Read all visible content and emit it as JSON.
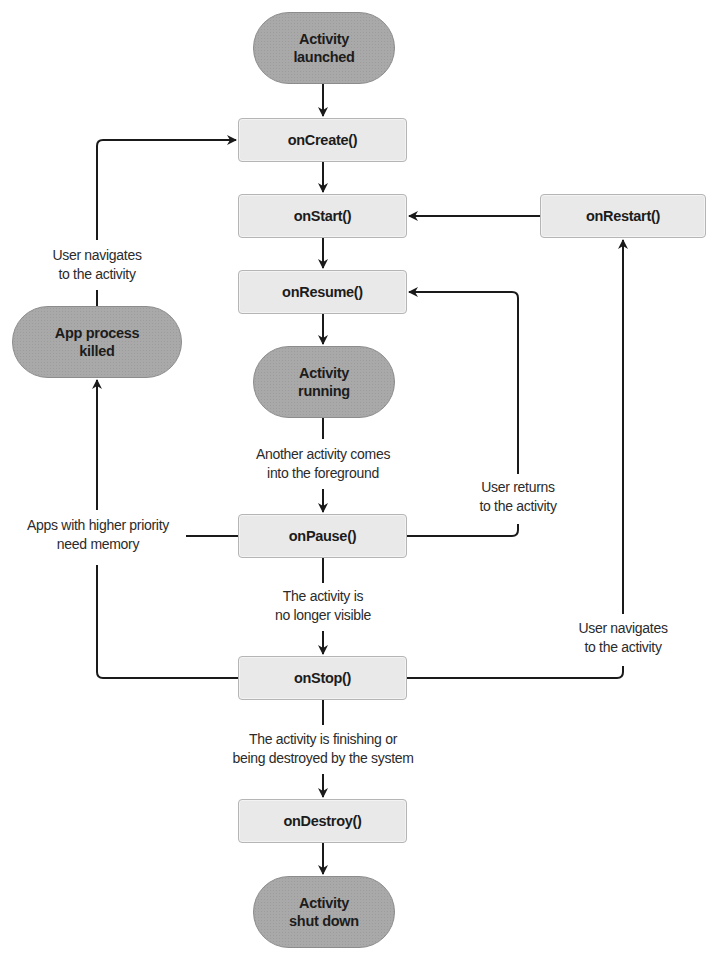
{
  "diagram": {
    "states": {
      "launched": "Activity launched",
      "launched_l1": "Activity",
      "launched_l2": "launched",
      "running_l1": "Activity",
      "running_l2": "running",
      "shutdown_l1": "Activity",
      "shutdown_l2": "shut down",
      "killed_l1": "App process",
      "killed_l2": "killed"
    },
    "methods": {
      "on_create": "onCreate()",
      "on_start": "onStart()",
      "on_resume": "onResume()",
      "on_pause": "onPause()",
      "on_stop": "onStop()",
      "on_destroy": "onDestroy()",
      "on_restart": "onRestart()"
    },
    "edge_labels": {
      "another_activity_l1": "Another activity comes",
      "another_activity_l2": "into the foreground",
      "not_visible_l1": "The activity is",
      "not_visible_l2": "no longer visible",
      "finishing_l1": "The activity is finishing or",
      "finishing_l2": "being destroyed by the system",
      "user_returns_l1": "User returns",
      "user_returns_l2": "to the activity",
      "user_navigates_right_l1": "User navigates",
      "user_navigates_right_l2": "to the activity",
      "user_navigates_left_l1": "User navigates",
      "user_navigates_left_l2": "to the activity",
      "higher_priority_l1": "Apps with higher priority",
      "higher_priority_l2": "need memory"
    },
    "colors": {
      "method_fill": "#e9e9e9",
      "state_fill": "#a9a9a9",
      "line": "#1a1a1a"
    }
  }
}
